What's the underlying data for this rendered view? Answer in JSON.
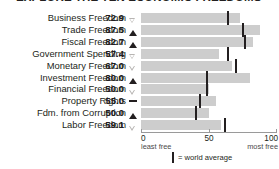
{
  "title": "EXPLORE THE TEN ECONOMIC FREEDOMS",
  "legend": {
    "world_average_label": "= world average",
    "marker_name": "world-average-marker"
  },
  "axis": {
    "ticks": [
      {
        "value": 0,
        "label": "0",
        "sub": "least free"
      },
      {
        "value": 50,
        "label": "50",
        "sub": ""
      },
      {
        "value": 100,
        "label": "100",
        "sub": "most free"
      }
    ],
    "min": 0,
    "max": 100
  },
  "colors": {
    "bar": "#cdcdcd",
    "tick": "#231f20",
    "text": "#231f20",
    "axis": "#9a9a9a",
    "arrow_down_fill": "#b8b5b3"
  },
  "chart_data": {
    "type": "bar",
    "title": "EXPLORE THE TEN ECONOMIC FREEDOMS",
    "xlabel": "",
    "ylabel": "",
    "xlim": [
      0,
      100
    ],
    "orientation": "horizontal",
    "grid": false,
    "legend_position": "bottom-center",
    "categories": [
      "Business Freedom",
      "Trade Freedom",
      "Fiscal Freedom",
      "Government Spending",
      "Monetary Freedom",
      "Investment Freedom",
      "Financial Freedom",
      "Property Rights",
      "Fdm. from Corruption",
      "Labor Freedom"
    ],
    "values": [
      72.9,
      87.5,
      82.7,
      57.4,
      67.0,
      80.0,
      50.0,
      55.0,
      50.0,
      59.1
    ],
    "value_labels": [
      "72.9",
      "87.5",
      "82.7",
      "57.4",
      "67.0",
      "80.0",
      "50.0",
      "55.0",
      "50.0",
      "59.1"
    ],
    "world_average": [
      64.3,
      74.8,
      76.3,
      63.9,
      70.2,
      48.8,
      48.5,
      43.6,
      40.5,
      61.5
    ],
    "trend": [
      "down",
      "up",
      "up",
      "down",
      "down",
      "up",
      "down",
      "flat",
      "up",
      "down"
    ],
    "series": [
      {
        "name": "Country score",
        "values": [
          72.9,
          87.5,
          82.7,
          57.4,
          67.0,
          80.0,
          50.0,
          55.0,
          50.0,
          59.1
        ]
      },
      {
        "name": "World average",
        "values": [
          64.3,
          74.8,
          76.3,
          63.9,
          70.2,
          48.8,
          48.5,
          43.6,
          40.5,
          61.5
        ]
      }
    ]
  }
}
